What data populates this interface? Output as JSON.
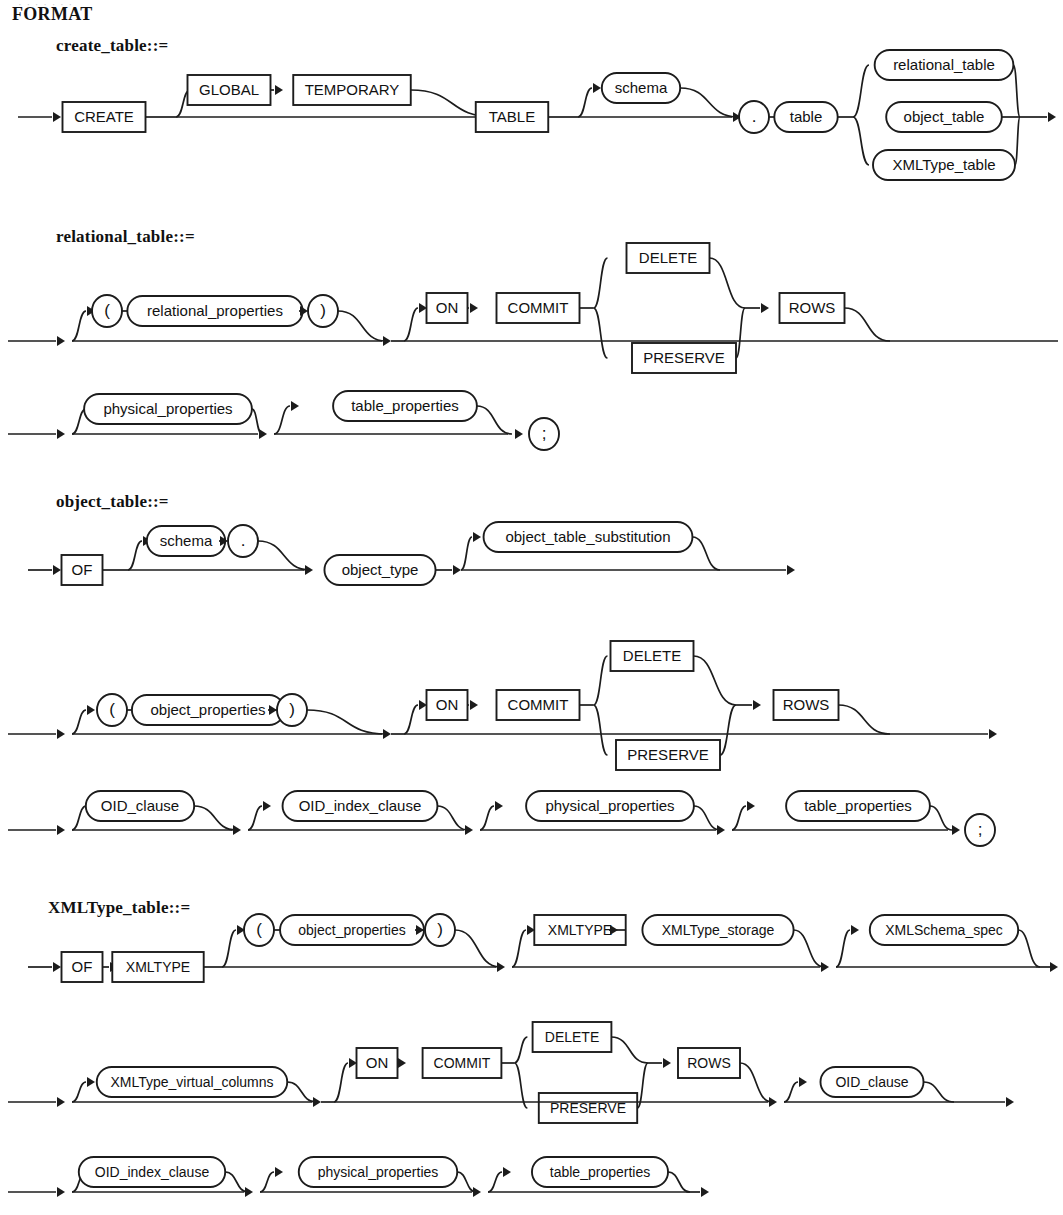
{
  "page": {
    "ghost_header": "· · · · · · ·",
    "format_heading": "FORMAT",
    "background": "#ffffff",
    "ink": "#1c1c1c"
  },
  "sections": [
    {
      "id": "create_table",
      "title": "create_table::=",
      "title_pos": {
        "x": 56,
        "y": 36
      },
      "rows": [
        {
          "id": "create-table-row-1",
          "nodes": [
            {
              "kind": "box",
              "label": "CREATE"
            },
            {
              "kind": "box",
              "label": "GLOBAL"
            },
            {
              "kind": "box",
              "label": "TEMPORARY"
            },
            {
              "kind": "box",
              "label": "TABLE"
            },
            {
              "kind": "oval",
              "label": "schema"
            },
            {
              "kind": "circle",
              "label": "."
            },
            {
              "kind": "oval",
              "label": "table"
            },
            {
              "kind": "oval",
              "label": "relational_table"
            },
            {
              "kind": "oval",
              "label": "object_table"
            },
            {
              "kind": "oval",
              "label": "XMLType_table"
            }
          ]
        }
      ]
    },
    {
      "id": "relational_table",
      "title": "relational_table::=",
      "title_pos": {
        "x": 56,
        "y": 227
      },
      "rows": [
        {
          "id": "relational-table-row-1",
          "nodes": [
            {
              "kind": "circle",
              "label": "("
            },
            {
              "kind": "oval",
              "label": "relational_properties"
            },
            {
              "kind": "circle",
              "label": ")"
            },
            {
              "kind": "box",
              "label": "ON"
            },
            {
              "kind": "box",
              "label": "COMMIT"
            },
            {
              "kind": "box",
              "label": "DELETE"
            },
            {
              "kind": "box",
              "label": "PRESERVE"
            },
            {
              "kind": "box",
              "label": "ROWS"
            }
          ]
        },
        {
          "id": "relational-table-row-2",
          "nodes": [
            {
              "kind": "oval",
              "label": "physical_properties"
            },
            {
              "kind": "oval",
              "label": "table_properties"
            },
            {
              "kind": "circle",
              "label": ";"
            }
          ]
        }
      ]
    },
    {
      "id": "object_table",
      "title": "object_table::=",
      "title_pos": {
        "x": 56,
        "y": 492
      },
      "rows": [
        {
          "id": "object-table-row-1",
          "nodes": [
            {
              "kind": "box",
              "label": "OF"
            },
            {
              "kind": "oval",
              "label": "schema"
            },
            {
              "kind": "circle",
              "label": "."
            },
            {
              "kind": "oval",
              "label": "object_type"
            },
            {
              "kind": "oval",
              "label": "object_table_substitution"
            }
          ]
        },
        {
          "id": "object-table-row-2",
          "nodes": [
            {
              "kind": "circle",
              "label": "("
            },
            {
              "kind": "oval",
              "label": "object_properties"
            },
            {
              "kind": "circle",
              "label": ")"
            },
            {
              "kind": "box",
              "label": "ON"
            },
            {
              "kind": "box",
              "label": "COMMIT"
            },
            {
              "kind": "box",
              "label": "DELETE"
            },
            {
              "kind": "box",
              "label": "PRESERVE"
            },
            {
              "kind": "box",
              "label": "ROWS"
            }
          ]
        },
        {
          "id": "object-table-row-3",
          "nodes": [
            {
              "kind": "oval",
              "label": "OID_clause"
            },
            {
              "kind": "oval",
              "label": "OID_index_clause"
            },
            {
              "kind": "oval",
              "label": "physical_properties"
            },
            {
              "kind": "oval",
              "label": "table_properties"
            },
            {
              "kind": "circle",
              "label": ";"
            }
          ]
        }
      ]
    },
    {
      "id": "xmltype_table",
      "title": "XMLType_table::=",
      "title_pos": {
        "x": 48,
        "y": 898
      },
      "rows": [
        {
          "id": "xmltype-table-row-1",
          "nodes": [
            {
              "kind": "box",
              "label": "OF"
            },
            {
              "kind": "box",
              "label": "XMLTYPE"
            },
            {
              "kind": "circle",
              "label": "("
            },
            {
              "kind": "oval",
              "label": "object_properties"
            },
            {
              "kind": "circle",
              "label": ")"
            },
            {
              "kind": "box",
              "label": "XMLTYPE"
            },
            {
              "kind": "oval",
              "label": "XMLType_storage"
            },
            {
              "kind": "oval",
              "label": "XMLSchema_spec"
            }
          ]
        },
        {
          "id": "xmltype-table-row-2",
          "nodes": [
            {
              "kind": "oval",
              "label": "XMLType_virtual_columns"
            },
            {
              "kind": "box",
              "label": "ON"
            },
            {
              "kind": "box",
              "label": "COMMIT"
            },
            {
              "kind": "box",
              "label": "DELETE"
            },
            {
              "kind": "box",
              "label": "PRESERVE"
            },
            {
              "kind": "box",
              "label": "ROWS"
            },
            {
              "kind": "oval",
              "label": "OID_clause"
            }
          ]
        },
        {
          "id": "xmltype-table-row-3",
          "nodes": [
            {
              "kind": "oval",
              "label": "OID_index_clause"
            },
            {
              "kind": "oval",
              "label": "physical_properties"
            },
            {
              "kind": "oval",
              "label": "table_properties"
            }
          ]
        }
      ]
    }
  ],
  "chart_data": {
    "type": "diagram",
    "notation": "railroad / syntax diagram",
    "diagrams": [
      {
        "name": "create_table::=",
        "terminals": [
          "CREATE",
          "GLOBAL",
          "TEMPORARY",
          "TABLE"
        ],
        "nonterminals": [
          "schema",
          "table",
          "relational_table",
          "object_table",
          "XMLType_table"
        ],
        "punctuation": [
          "."
        ]
      },
      {
        "name": "relational_table::=",
        "terminals": [
          "ON",
          "COMMIT",
          "DELETE",
          "PRESERVE",
          "ROWS"
        ],
        "nonterminals": [
          "relational_properties",
          "physical_properties",
          "table_properties"
        ],
        "punctuation": [
          "(",
          ")",
          ";"
        ]
      },
      {
        "name": "object_table::=",
        "terminals": [
          "OF",
          "ON",
          "COMMIT",
          "DELETE",
          "PRESERVE",
          "ROWS"
        ],
        "nonterminals": [
          "schema",
          "object_type",
          "object_table_substitution",
          "object_properties",
          "OID_clause",
          "OID_index_clause",
          "physical_properties",
          "table_properties"
        ],
        "punctuation": [
          ".",
          "(",
          ")",
          ";"
        ]
      },
      {
        "name": "XMLType_table::=",
        "terminals": [
          "OF",
          "XMLTYPE",
          "ON",
          "COMMIT",
          "DELETE",
          "PRESERVE",
          "ROWS"
        ],
        "nonterminals": [
          "object_properties",
          "XMLType_storage",
          "XMLSchema_spec",
          "XMLType_virtual_columns",
          "OID_clause",
          "OID_index_clause",
          "physical_properties",
          "table_properties"
        ],
        "punctuation": [
          "(",
          ")"
        ]
      }
    ]
  }
}
